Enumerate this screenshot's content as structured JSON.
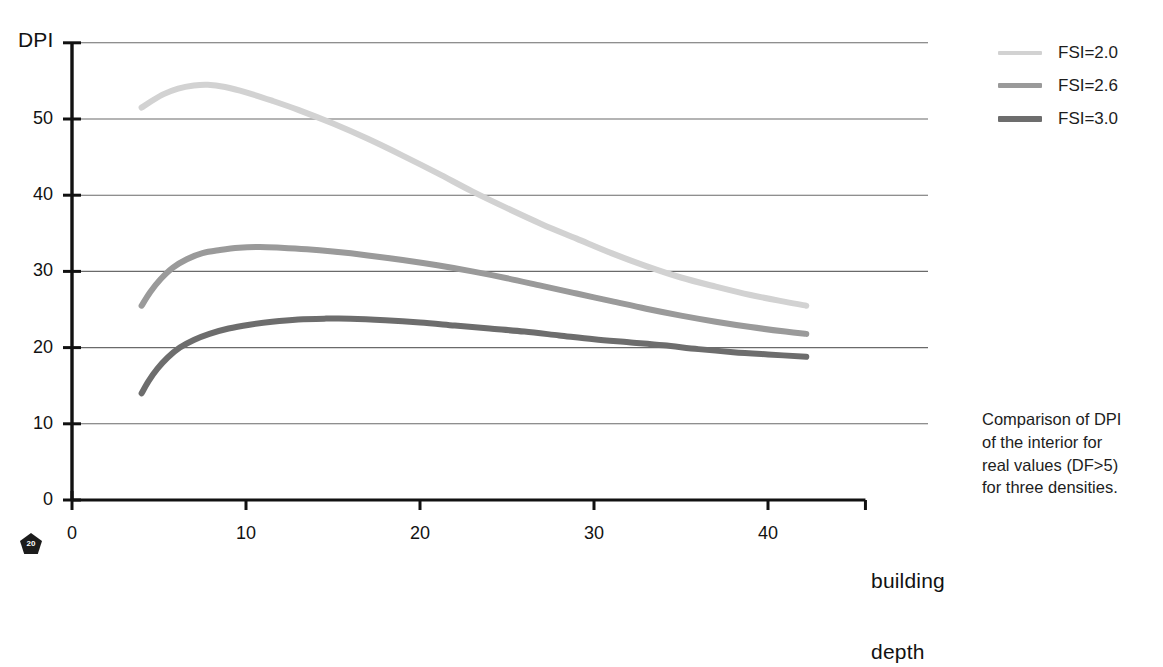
{
  "chart_data": {
    "type": "line",
    "title": "",
    "xlabel": "building depth",
    "ylabel": "DPI",
    "xlim": [
      0,
      46
    ],
    "ylim": [
      0,
      60
    ],
    "xticks": [
      0,
      10,
      20,
      30,
      40
    ],
    "yticks": [
      0,
      10,
      20,
      30,
      40,
      50
    ],
    "xtick_labels": [
      "0",
      "10",
      "20",
      "30",
      "40"
    ],
    "ytick_labels": [
      "0",
      "10",
      "20",
      "30",
      "40",
      "50"
    ],
    "grid": "horizontal",
    "legend_position": "top-right",
    "series": [
      {
        "name": "FSI=2.0",
        "color": "#d2d2d2",
        "width": 6,
        "points": [
          [
            4.0,
            51.5
          ],
          [
            4.6,
            52.4
          ],
          [
            5.3,
            53.3
          ],
          [
            6.1,
            54.0
          ],
          [
            7.0,
            54.4
          ],
          [
            7.8,
            54.5
          ],
          [
            8.8,
            54.2
          ],
          [
            10.0,
            53.5
          ],
          [
            11.5,
            52.4
          ],
          [
            13.0,
            51.2
          ],
          [
            15.0,
            49.4
          ],
          [
            17.0,
            47.4
          ],
          [
            19.0,
            45.2
          ],
          [
            21.0,
            42.9
          ],
          [
            23.0,
            40.5
          ],
          [
            25.0,
            38.3
          ],
          [
            27.0,
            36.2
          ],
          [
            29.0,
            34.3
          ],
          [
            31.0,
            32.4
          ],
          [
            33.0,
            30.7
          ],
          [
            35.0,
            29.2
          ],
          [
            37.0,
            28.0
          ],
          [
            39.0,
            26.9
          ],
          [
            41.0,
            26.0
          ],
          [
            42.2,
            25.5
          ]
        ]
      },
      {
        "name": "FSI=2.6",
        "color": "#9a9a9a",
        "width": 6,
        "points": [
          [
            4.0,
            25.5
          ],
          [
            4.5,
            27.3
          ],
          [
            5.1,
            29.0
          ],
          [
            5.8,
            30.5
          ],
          [
            6.6,
            31.6
          ],
          [
            7.5,
            32.4
          ],
          [
            8.5,
            32.8
          ],
          [
            9.6,
            33.1
          ],
          [
            10.8,
            33.2
          ],
          [
            12.0,
            33.1
          ],
          [
            13.5,
            32.9
          ],
          [
            15.0,
            32.6
          ],
          [
            17.0,
            32.1
          ],
          [
            19.0,
            31.5
          ],
          [
            21.0,
            30.8
          ],
          [
            23.0,
            30.0
          ],
          [
            25.0,
            29.1
          ],
          [
            27.0,
            28.1
          ],
          [
            29.0,
            27.1
          ],
          [
            31.0,
            26.1
          ],
          [
            33.0,
            25.1
          ],
          [
            35.0,
            24.2
          ],
          [
            37.0,
            23.4
          ],
          [
            39.0,
            22.7
          ],
          [
            41.0,
            22.1
          ],
          [
            42.2,
            21.8
          ]
        ]
      },
      {
        "name": "FSI=3.0",
        "color": "#6d6d6d",
        "width": 6,
        "points": [
          [
            4.0,
            14.0
          ],
          [
            4.4,
            15.6
          ],
          [
            4.9,
            17.2
          ],
          [
            5.5,
            18.7
          ],
          [
            6.2,
            20.0
          ],
          [
            7.0,
            21.0
          ],
          [
            7.9,
            21.8
          ],
          [
            9.0,
            22.5
          ],
          [
            10.2,
            23.0
          ],
          [
            11.5,
            23.4
          ],
          [
            13.0,
            23.7
          ],
          [
            14.5,
            23.8
          ],
          [
            16.0,
            23.8
          ],
          [
            18.0,
            23.6
          ],
          [
            20.0,
            23.3
          ],
          [
            22.0,
            22.9
          ],
          [
            24.0,
            22.5
          ],
          [
            26.0,
            22.1
          ],
          [
            28.0,
            21.6
          ],
          [
            30.0,
            21.1
          ],
          [
            32.0,
            20.7
          ],
          [
            34.0,
            20.3
          ],
          [
            36.0,
            19.8
          ],
          [
            38.0,
            19.4
          ],
          [
            40.0,
            19.1
          ],
          [
            42.2,
            18.8
          ]
        ]
      }
    ]
  },
  "axes": {
    "y_title": "DPI",
    "x_title_line1": "building",
    "x_title_line2": "depth"
  },
  "legend": {
    "items": [
      {
        "label": "FSI=2.0",
        "color": "#d2d2d2"
      },
      {
        "label": "FSI=2.6",
        "color": "#9a9a9a"
      },
      {
        "label": "FSI=3.0",
        "color": "#6d6d6d"
      }
    ]
  },
  "caption": {
    "line1": "Comparison of DPI",
    "line2": "of the interior for",
    "line3": "real values (DF>5)",
    "line4": "for three densities."
  },
  "page_badge": {
    "number": "20"
  },
  "colors": {
    "axis": "#111111",
    "gridline": "#6a6a6a",
    "text": "#1a1a1a",
    "background": "#ffffff"
  }
}
